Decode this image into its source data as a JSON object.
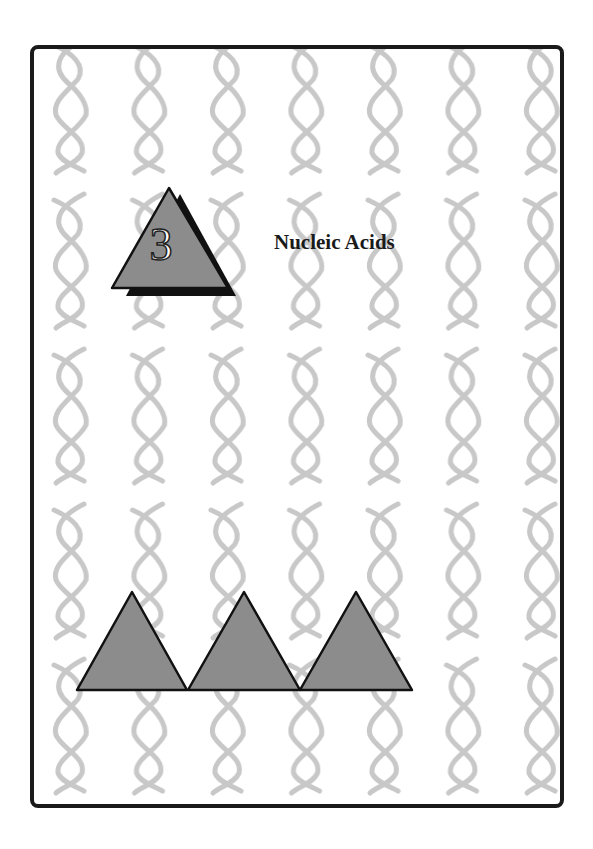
{
  "page": {
    "chapter_number": "3",
    "chapter_title": "Nucleic Acids"
  },
  "decoration": {
    "background_motif": "dna-double-helix",
    "badge_shape": "triangle-with-shadow",
    "footer_shapes": [
      "triangle",
      "triangle",
      "triangle"
    ]
  },
  "colors": {
    "frame": "#1a1a1a",
    "triangle_fill": "#8c8c8c",
    "triangle_stroke": "#111111",
    "shadow": "#111111",
    "helix": "#c8c8c8",
    "background": "#ffffff"
  }
}
